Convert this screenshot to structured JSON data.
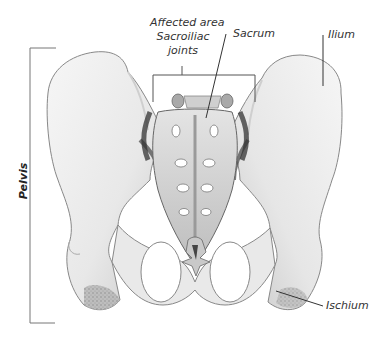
{
  "figure": {
    "labels": {
      "affected_area": "Affected area",
      "sacroiliac_1": "Sacroiliac",
      "sacroiliac_2": "joints",
      "sacrum": "Sacrum",
      "ilium": "Ilium",
      "ischium": "Ischium",
      "pelvis": "Pelvis"
    },
    "colors": {
      "bone_fill": "#efefef",
      "bone_shade": "#bdbdbd",
      "bone_dark": "#555555",
      "outline": "#777777",
      "leader_line": "#444444",
      "joint_fill": "#a9a9a9"
    }
  }
}
